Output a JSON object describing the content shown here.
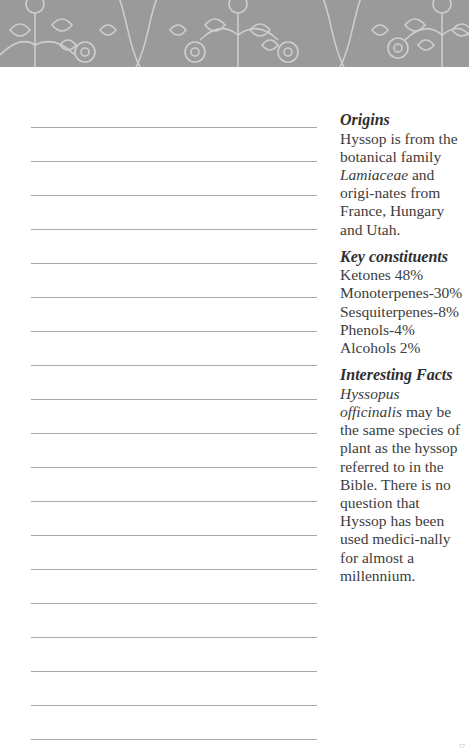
{
  "header": {
    "pattern": "floral-ornamental-band",
    "color": "#9a9a9a"
  },
  "notes": {
    "line_count": 19,
    "first_line_y": 127,
    "line_spacing": 34
  },
  "sidebar": {
    "origins": {
      "heading": "Origins",
      "text_1": "Hyssop is from the botanical family ",
      "text_italic": "Lamiaceae",
      "text_2": " and origi-nates from France, Hungary and Utah."
    },
    "constituents": {
      "heading": "Key constituents",
      "items": [
        "Ketones 48%",
        "Monoterpenes-30%",
        "Sesquiterpenes-8%",
        "Phenols-4%",
        "Alcohols 2%"
      ]
    },
    "facts": {
      "heading": "Interesting Facts",
      "text_italic": "Hyssopus officinalis",
      "text_1": " may be the same species of plant as the hyssop referred to in the Bible. There is no question that Hyssop has been used medici-nally for almost a millennium."
    }
  },
  "footer": {
    "page_number": "57"
  }
}
